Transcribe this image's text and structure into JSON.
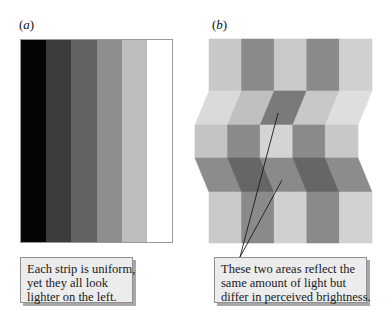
{
  "panels": {
    "a": {
      "label_open": "(",
      "label_letter": "a",
      "label_close": ")",
      "strips": [
        "#050505",
        "#3c3c3c",
        "#636363",
        "#8e8e8e",
        "#bdbdbd",
        "#ffffff"
      ],
      "callout_lines": [
        "Each strip is uniform,",
        "yet they all look",
        "lighter on the left."
      ]
    },
    "b": {
      "label_open": "(",
      "label_letter": "b",
      "label_close": ")",
      "rows": [
        {
          "type": "rect",
          "y0": 39,
          "y1": 91,
          "x0_top": 209,
          "x0_bottom": 209,
          "colors": [
            "#c8c8c8",
            "#8a8a8a",
            "#cacaca",
            "#8a8a8a",
            "#d0d0d0"
          ]
        },
        {
          "type": "slant",
          "y0": 91,
          "y1": 125,
          "x0_top": 209,
          "x0_bottom": 195,
          "colors": [
            "#dadada",
            "#c0c0c0",
            "#7a7a7a",
            "#c8c8c8",
            "#dedede"
          ]
        },
        {
          "type": "rect",
          "y0": 125,
          "y1": 158,
          "x0_top": 195,
          "x0_bottom": 195,
          "colors": [
            "#c4c4c4",
            "#8a8a8a",
            "#d4d4d4",
            "#8a8a8a",
            "#c8c8c8"
          ]
        },
        {
          "type": "slant",
          "y0": 158,
          "y1": 192,
          "x0_top": 195,
          "x0_bottom": 209,
          "colors": [
            "#8c8c8c",
            "#666666",
            "#8a8a8a",
            "#666666",
            "#8c8c8c"
          ]
        },
        {
          "type": "rect",
          "y0": 192,
          "y1": 243,
          "x0_top": 209,
          "x0_bottom": 209,
          "colors": [
            "#cacaca",
            "#8a8a8a",
            "#d0d0d0",
            "#8a8a8a",
            "#d2d2d2"
          ]
        }
      ],
      "column_width": 32.6,
      "pointer_lines": [
        {
          "x1": 278,
          "y1": 113,
          "x2": 240,
          "y2": 257
        },
        {
          "x1": 282,
          "y1": 180,
          "x2": 240,
          "y2": 257
        }
      ],
      "callout_lines": [
        "These two areas reflect the",
        "same amount of light but",
        "differ in perceived brightness."
      ]
    }
  }
}
